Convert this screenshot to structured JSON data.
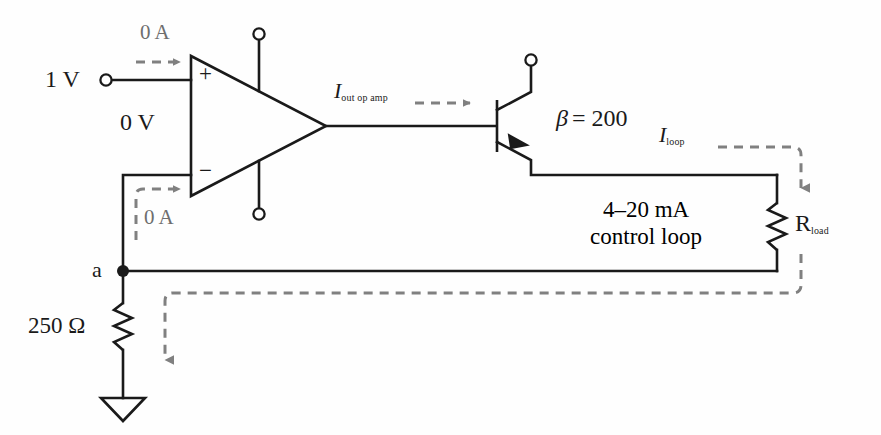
{
  "diagram": {
    "colors": {
      "wire": "#1a1a1a",
      "dashed_current": "#808080",
      "text": "#1a1a1a",
      "text_gray": "#6e6e6e",
      "background": "#fefefe"
    },
    "labels": {
      "source_voltage": "1 V",
      "input_current_top": "0 A",
      "virtual_ground": "0 V",
      "input_current_bottom": "0 A",
      "opamp_plus": "+",
      "opamp_minus": "−",
      "opamp_output_current_symbol": "I",
      "opamp_output_current_subscript": "out op amp",
      "beta_symbol": "β",
      "beta_equals_value": "= 200",
      "loop_current_symbol": "I",
      "loop_current_subscript": "loop",
      "loop_description_line1": "4–20 mA",
      "loop_description_line2": "control loop",
      "load_resistor_symbol": "R",
      "load_resistor_subscript": "load",
      "node_label": "a",
      "sense_resistor": "250 Ω"
    },
    "components": [
      {
        "name": "opamp",
        "type": "operational-amplifier",
        "inputs": [
          "+",
          "−"
        ],
        "supply_pins": 2
      },
      {
        "name": "transistor",
        "type": "npn-bjt",
        "beta": "200"
      },
      {
        "name": "load-resistor",
        "type": "resistor",
        "value_label": "R load"
      },
      {
        "name": "sense-resistor",
        "type": "resistor",
        "value_label": "250 Ω"
      },
      {
        "name": "ground",
        "type": "ground-symbol"
      },
      {
        "name": "input-terminal",
        "type": "open-terminal",
        "value_label": "1 V"
      },
      {
        "name": "supply-terminal-top",
        "type": "open-terminal"
      },
      {
        "name": "supply-terminal-bottom",
        "type": "open-terminal"
      },
      {
        "name": "collector-terminal",
        "type": "open-terminal"
      },
      {
        "name": "node-a",
        "type": "junction-dot",
        "value_label": "a"
      }
    ],
    "current_arrows": [
      {
        "name": "input-bias-current-top",
        "label": "0 A"
      },
      {
        "name": "input-bias-current-bottom",
        "label": "0 A"
      },
      {
        "name": "opamp-output-current",
        "label": "I out op amp"
      },
      {
        "name": "loop-current",
        "label": "I loop"
      },
      {
        "name": "sense-resistor-current",
        "label": ""
      }
    ]
  }
}
